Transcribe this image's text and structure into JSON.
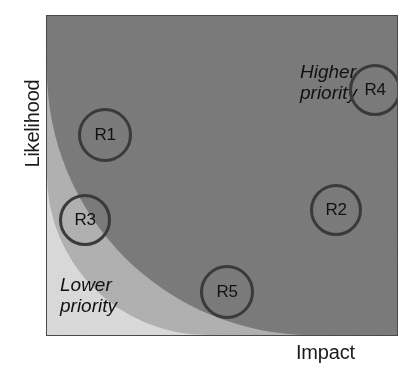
{
  "figure": {
    "name": "risk-prioritization-matrix",
    "x_axis_label": "Impact",
    "y_axis_label": "Likelihood"
  },
  "zones": [
    {
      "id": "higher-priority",
      "caption": "Higher\npriority",
      "color": "#7d7d7d",
      "rank": 3
    },
    {
      "id": "medium-priority",
      "caption": "",
      "color": "#b4b4b4",
      "rank": 2
    },
    {
      "id": "lower-priority",
      "caption": "Lower\npriority",
      "color": "#dedede",
      "rank": 1
    }
  ],
  "risks": [
    {
      "id": "R1",
      "label": "R1",
      "cx": 105,
      "cy": 135,
      "r": 27,
      "zone": "medium-priority"
    },
    {
      "id": "R2",
      "label": "R2",
      "cx": 336,
      "cy": 210,
      "r": 26,
      "zone": "higher-priority"
    },
    {
      "id": "R3",
      "label": "R3",
      "cx": 85,
      "cy": 220,
      "r": 26,
      "zone": "lower-priority"
    },
    {
      "id": "R4",
      "label": "R4",
      "cx": 375,
      "cy": 90,
      "r": 26,
      "zone": "higher-priority"
    },
    {
      "id": "R5",
      "label": "R5",
      "cx": 227,
      "cy": 292,
      "r": 27,
      "zone": "medium-priority"
    }
  ],
  "chart_data": {
    "type": "scatter",
    "title": "",
    "xlabel": "Impact",
    "ylabel": "Likelihood",
    "xlim": [
      0,
      1
    ],
    "ylim": [
      0,
      1
    ],
    "grid": false,
    "legend": null,
    "annotations": [
      "Higher priority",
      "Lower priority"
    ],
    "bands": {
      "description": "Three concentric quarter-circle priority bands centred on the bottom-left (low impact, low likelihood) corner.",
      "boundaries_radius_fraction": [
        0.5,
        0.83
      ],
      "labels": [
        "Lower priority",
        "",
        "Higher priority"
      ],
      "colors": [
        "#dedede",
        "#b4b4b4",
        "#7d7d7d"
      ]
    },
    "points": [
      {
        "label": "R1",
        "x": 0.17,
        "y": 0.63
      },
      {
        "label": "R2",
        "x": 0.83,
        "y": 0.39
      },
      {
        "label": "R3",
        "x": 0.11,
        "y": 0.36
      },
      {
        "label": "R4",
        "x": 0.94,
        "y": 0.77
      },
      {
        "label": "R5",
        "x": 0.51,
        "y": 0.13
      }
    ]
  },
  "colors": {
    "zone_high": "#7d7d7d",
    "zone_medium": "#b4b4b4",
    "zone_low": "#dedede",
    "marker_stroke": "#3a3a3a",
    "text": "#111111",
    "border": "#4a4a4a"
  }
}
